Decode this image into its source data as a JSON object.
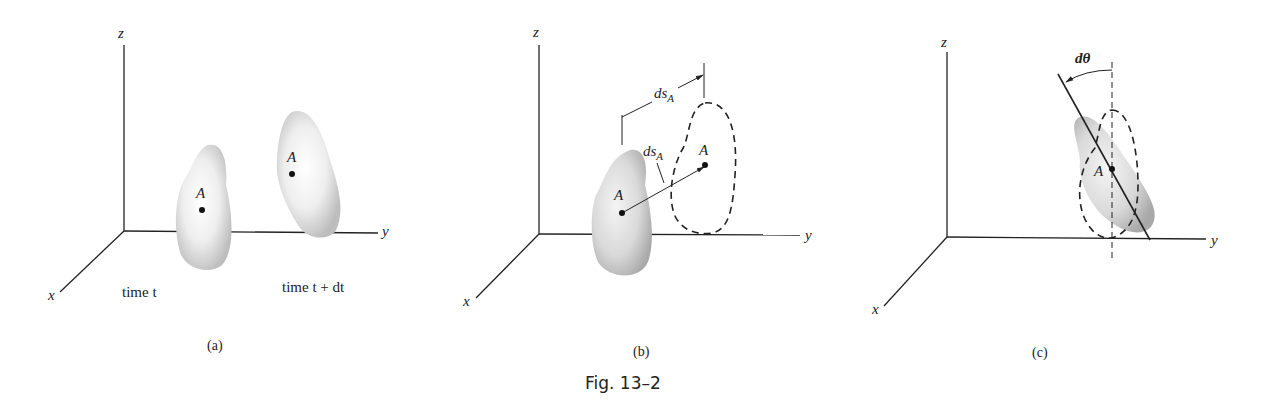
{
  "figure": {
    "caption": "Fig. 13–2",
    "panels": [
      {
        "id": "a",
        "caption": "(a)",
        "axes": {
          "x": "x",
          "y": "y",
          "z": "z"
        },
        "point_labels": [
          "A",
          "A"
        ],
        "time_labels": [
          "time t",
          "time t + dt"
        ]
      },
      {
        "id": "b",
        "caption": "(b)",
        "axes": {
          "x": "x",
          "y": "y",
          "z": "z"
        },
        "point_labels": [
          "A",
          "A"
        ],
        "dimension_label": "ds",
        "dimension_subscript": "A",
        "vector_label": "ds",
        "vector_subscript": "A"
      },
      {
        "id": "c",
        "caption": "(c)",
        "axes": {
          "x": "x",
          "y": "y",
          "z": "z"
        },
        "point_label": "A",
        "angle_label": "dθ"
      }
    ]
  }
}
